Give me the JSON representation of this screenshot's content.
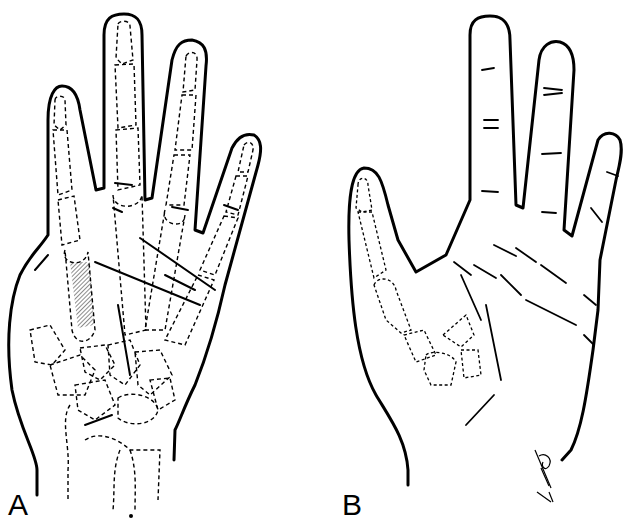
{
  "figure": {
    "panels": [
      {
        "label": "A",
        "description": "Palmar view of hand with dashed skeletal overlay (phalanges, metacarpals, carpals, radius/ulna), hatched first metacarpal and skin crease incision lines"
      },
      {
        "label": "B",
        "description": "Palmar view of hand outline with skin creases and dashed thumb/carpal bone overlay"
      }
    ],
    "signature": "artist signature",
    "colors": {
      "line": "#000000",
      "background": "#ffffff"
    }
  }
}
